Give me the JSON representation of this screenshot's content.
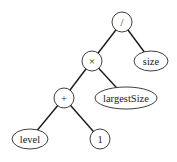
{
  "diagram": {
    "type": "expression-tree",
    "nodes": [
      {
        "id": "div",
        "label": "/",
        "shape": "circle",
        "cx": 122,
        "cy": 22,
        "r": 10
      },
      {
        "id": "mul",
        "label": "×",
        "shape": "circle",
        "cx": 92,
        "cy": 61,
        "r": 10
      },
      {
        "id": "size",
        "label": "size",
        "shape": "ellipse",
        "cx": 151,
        "cy": 61,
        "rx": 17,
        "ry": 10
      },
      {
        "id": "plus",
        "label": "+",
        "shape": "circle",
        "cx": 64,
        "cy": 98,
        "r": 10
      },
      {
        "id": "largestSize",
        "label": "largestSize",
        "shape": "ellipse",
        "cx": 126,
        "cy": 98,
        "rx": 31,
        "ry": 11
      },
      {
        "id": "level",
        "label": "level",
        "shape": "ellipse",
        "cx": 30,
        "cy": 139,
        "rx": 18,
        "ry": 10
      },
      {
        "id": "one",
        "label": "1",
        "shape": "circle",
        "cx": 100,
        "cy": 139,
        "r": 10
      }
    ],
    "edges": [
      {
        "from": "div",
        "to": "mul"
      },
      {
        "from": "div",
        "to": "size"
      },
      {
        "from": "mul",
        "to": "plus"
      },
      {
        "from": "mul",
        "to": "largestSize"
      },
      {
        "from": "plus",
        "to": "level"
      },
      {
        "from": "plus",
        "to": "one"
      }
    ]
  }
}
